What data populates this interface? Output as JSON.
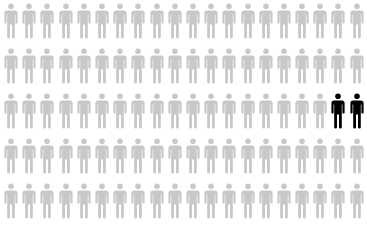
{
  "chart_data": {
    "type": "pictogram",
    "title": "",
    "rows": 5,
    "columns": 20,
    "total": 100,
    "highlighted": 2,
    "unhighlighted": 98,
    "highlighted_positions": [
      {
        "row": 3,
        "col": 19
      },
      {
        "row": 3,
        "col": 20
      }
    ],
    "categories": [
      "highlighted",
      "other"
    ],
    "values": [
      2,
      98
    ],
    "colors": {
      "highlighted": "#000000",
      "other": "#c8c8c8"
    },
    "icon": "person-icon"
  }
}
